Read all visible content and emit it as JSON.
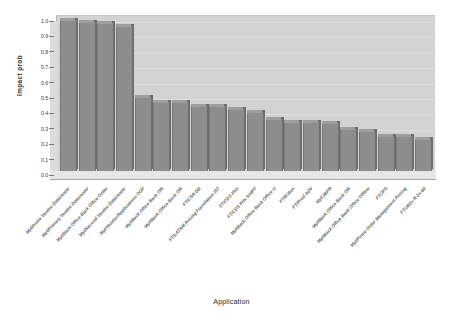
{
  "chart_data": {
    "type": "bar",
    "title": "",
    "xlabel": "Application",
    "ylabel": "Impact prob",
    "ylim": [
      0.0,
      1.0
    ],
    "ytick_labels": [
      "1.0",
      "0.9",
      "0.8",
      "0.7",
      "0.6",
      "0.5",
      "0.4",
      "0.3",
      "0.2",
      "0.1",
      "0.0"
    ],
    "ytick_values": [
      1.0,
      0.9,
      0.8,
      0.7,
      0.6,
      0.5,
      0.4,
      0.3,
      0.2,
      0.1,
      0.0
    ],
    "grid": true,
    "legend": "none",
    "style": "3d-bar",
    "bar_color": "#8d8d8d",
    "panel_color": "#d2d2d2",
    "categories": [
      "Myl/Prime Vendor Datacenter",
      "Myl/Primary Vendor Datacenter",
      "Myl/Back Office Back Office Order",
      "Myl/Second Vendor Datacenter",
      "Myl/Vendor/Applications OGP",
      "Myl/Back Office Back Offi",
      "Myl/Back Office Back Offi",
      "FT/CSR DB",
      "FT/LATAM Pricing Foundation IST",
      "FT/CDS PHx",
      "FT/CDS PHx SHIPT",
      "Myl/Back Office Back Office U",
      "FT/R-Bus",
      "FT/Prod ADV",
      "Myl/JBPR",
      "Myl/Back Office Back Offi",
      "Myl/Back Office Back Office Offline",
      "FT/JPS",
      "Myl/Prime Order Management Pricing",
      "FT/JB2x R-2x-80"
    ],
    "values": [
      0.98,
      0.97,
      0.96,
      0.94,
      0.48,
      0.45,
      0.45,
      0.42,
      0.42,
      0.4,
      0.38,
      0.34,
      0.32,
      0.32,
      0.31,
      0.27,
      0.26,
      0.23,
      0.23,
      0.21
    ]
  },
  "axis": {
    "y_label": "Impact prob",
    "x_label": "Application"
  }
}
